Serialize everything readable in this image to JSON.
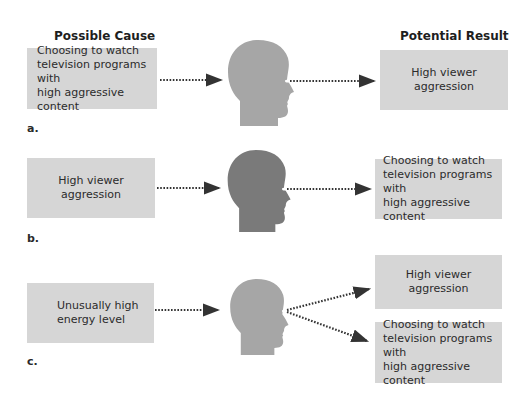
{
  "headers": {
    "left": "Possible Cause",
    "right": "Potential Result"
  },
  "panels": [
    {
      "label": "a.",
      "cause": "Choosing to watch\ntelevision programs with\nhigh aggressive content",
      "results": [
        "High viewer aggression"
      ],
      "head_color": "#a6a6a6"
    },
    {
      "label": "b.",
      "cause": "High viewer aggression",
      "results": [
        "Choosing to watch\ntelevision programs with\nhigh aggressive content"
      ],
      "head_color": "#7a7a7a"
    },
    {
      "label": "c.",
      "cause": "Unusually high\nenergy level",
      "results": [
        "High viewer aggression",
        "Choosing to watch\ntelevision programs with\nhigh aggressive content"
      ],
      "head_color": "#a6a6a6"
    }
  ],
  "colors": {
    "box": "#d6d6d6",
    "arrow": "#333333"
  }
}
